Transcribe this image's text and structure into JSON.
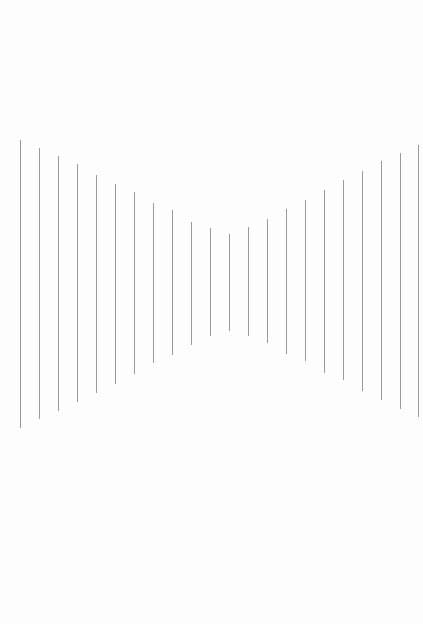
{
  "diagram": {
    "type": "vertical-line-illusion",
    "line_color": "#9a9a9a",
    "background_color": "#fdfdfd",
    "lines": [
      {
        "x": 20,
        "top": 140,
        "bottom": 428
      },
      {
        "x": 39,
        "top": 148,
        "bottom": 419
      },
      {
        "x": 58,
        "top": 156,
        "bottom": 411
      },
      {
        "x": 77,
        "top": 164,
        "bottom": 402
      },
      {
        "x": 96,
        "top": 175,
        "bottom": 393
      },
      {
        "x": 115,
        "top": 184,
        "bottom": 384
      },
      {
        "x": 134,
        "top": 192,
        "bottom": 374
      },
      {
        "x": 153,
        "top": 203,
        "bottom": 363
      },
      {
        "x": 172,
        "top": 210,
        "bottom": 355
      },
      {
        "x": 191,
        "top": 222,
        "bottom": 345
      },
      {
        "x": 210,
        "top": 228,
        "bottom": 336
      },
      {
        "x": 229,
        "top": 234,
        "bottom": 331
      },
      {
        "x": 248,
        "top": 227,
        "bottom": 336
      },
      {
        "x": 267,
        "top": 219,
        "bottom": 343
      },
      {
        "x": 286,
        "top": 209,
        "bottom": 354
      },
      {
        "x": 305,
        "top": 200,
        "bottom": 361
      },
      {
        "x": 324,
        "top": 190,
        "bottom": 373
      },
      {
        "x": 343,
        "top": 180,
        "bottom": 380
      },
      {
        "x": 362,
        "top": 171,
        "bottom": 391
      },
      {
        "x": 381,
        "top": 161,
        "bottom": 400
      },
      {
        "x": 400,
        "top": 153,
        "bottom": 409
      },
      {
        "x": 418,
        "top": 145,
        "bottom": 417
      }
    ]
  }
}
